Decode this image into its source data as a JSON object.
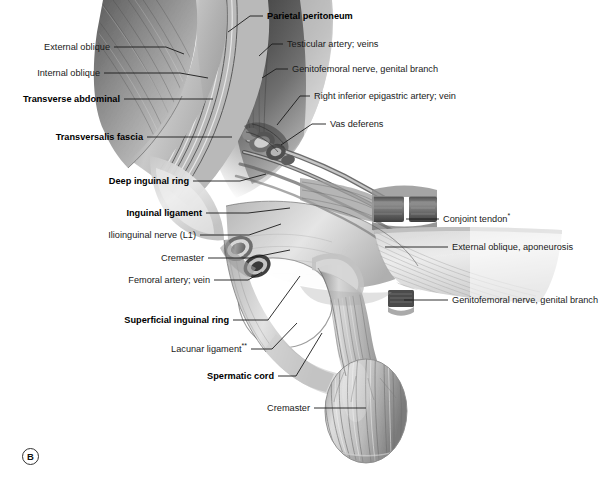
{
  "figure": {
    "panel_letter": "B",
    "background_color": "#ffffff",
    "ink_color": "#1a1a1a"
  },
  "labels_left": [
    {
      "id": "external-oblique",
      "text": "External oblique",
      "bold": false,
      "text_x": 110,
      "text_y": 50,
      "leader": [
        114,
        47,
        166,
        47,
        184,
        54
      ]
    },
    {
      "id": "internal-oblique",
      "text": "Internal oblique",
      "bold": false,
      "text_x": 100,
      "text_y": 76,
      "leader": [
        104,
        73,
        180,
        73,
        208,
        78
      ]
    },
    {
      "id": "transverse-abdominal",
      "text": "Transverse abdominal",
      "bold": true,
      "text_x": 120,
      "text_y": 102,
      "leader": [
        124,
        99,
        187,
        99,
        213,
        99
      ]
    },
    {
      "id": "transversalis-fascia",
      "text": "Transversalis fascia",
      "bold": true,
      "text_x": 143,
      "text_y": 140,
      "leader": [
        147,
        137,
        210,
        137,
        232,
        137
      ]
    },
    {
      "id": "deep-inguinal-ring",
      "text": "Deep inguinal ring",
      "bold": true,
      "text_x": 189,
      "text_y": 184,
      "leader": [
        193,
        181,
        240,
        181,
        266,
        174
      ]
    },
    {
      "id": "inguinal-ligament",
      "text": "Inguinal ligament",
      "bold": true,
      "text_x": 202,
      "text_y": 216,
      "leader": [
        206,
        213,
        248,
        213,
        290,
        208
      ]
    },
    {
      "id": "ilioinguinal-nerve",
      "text": "Ilioinguinal nerve (L1)",
      "bold": false,
      "text_x": 196,
      "text_y": 238,
      "leader": [
        200,
        235,
        249,
        235,
        281,
        224
      ]
    },
    {
      "id": "cremaster-upper",
      "text": "Cremaster",
      "bold": false,
      "text_x": 204,
      "text_y": 261,
      "leader": [
        208,
        258,
        250,
        258,
        290,
        250
      ]
    },
    {
      "id": "femoral-artery-vein",
      "text": "Femoral artery; vein",
      "bold": false,
      "text_x": 210,
      "text_y": 283,
      "leader": [
        214,
        280,
        248,
        280,
        262,
        272
      ]
    },
    {
      "id": "superficial-inguinal-ring",
      "text": "Superficial inguinal ring",
      "bold": true,
      "text_x": 229,
      "text_y": 323,
      "leader": [
        233,
        320,
        268,
        320,
        300,
        276
      ]
    },
    {
      "id": "lacunar-ligament",
      "text": "Lacunar ligament",
      "suffix": "**",
      "bold": false,
      "text_x": 247,
      "text_y": 352,
      "leader": [
        251,
        349,
        272,
        349,
        297,
        323
      ]
    },
    {
      "id": "spermatic-cord",
      "text": "Spermatic cord",
      "bold": true,
      "text_x": 274,
      "text_y": 379,
      "leader": [
        278,
        376,
        296,
        376,
        322,
        333
      ]
    },
    {
      "id": "cremaster-lower",
      "text": "Cremaster",
      "bold": false,
      "text_x": 310,
      "text_y": 411,
      "leader": [
        314,
        408,
        356,
        408,
        366,
        408
      ]
    }
  ],
  "labels_right": [
    {
      "id": "parietal-peritoneum",
      "text": "Parietal peritoneum",
      "bold": true,
      "text_x": 267,
      "text_y": 19,
      "leader": [
        263,
        16,
        250,
        16,
        228,
        32
      ]
    },
    {
      "id": "testicular-artery-veins",
      "text": "Testicular artery; veins",
      "bold": false,
      "text_x": 287,
      "text_y": 47,
      "leader": [
        283,
        44,
        272,
        44,
        259,
        56
      ]
    },
    {
      "id": "genitofemoral-nerve-genital-branch-upper",
      "text": "Genitofemoral nerve, genital branch",
      "bold": false,
      "text_x": 292,
      "text_y": 72,
      "leader": [
        288,
        69,
        276,
        69,
        262,
        78
      ]
    },
    {
      "id": "right-inferior-epigastric",
      "text": "Right inferior epigastric artery; vein",
      "bold": false,
      "text_x": 314,
      "text_y": 99,
      "leader": [
        310,
        96,
        300,
        96,
        277,
        125
      ]
    },
    {
      "id": "vas-deferens",
      "text": "Vas deferens",
      "bold": false,
      "text_x": 330,
      "text_y": 127,
      "leader": [
        326,
        124,
        312,
        124,
        281,
        145
      ]
    },
    {
      "id": "conjoint-tendon",
      "text": "Conjoint tendon",
      "suffix": "*",
      "bold": false,
      "text_x": 443,
      "text_y": 222,
      "leader": [
        439,
        219,
        420,
        219,
        406,
        219
      ]
    },
    {
      "id": "external-oblique-aponeurosis",
      "text": "External oblique, aponeurosis",
      "bold": false,
      "text_x": 452,
      "text_y": 250,
      "leader": [
        448,
        247,
        400,
        247,
        385,
        247
      ]
    },
    {
      "id": "genitofemoral-nerve-genital-branch-lower",
      "text": "Genitofemoral nerve, genital branch",
      "bold": false,
      "text_x": 452,
      "text_y": 303,
      "leader": [
        448,
        300,
        420,
        300,
        404,
        300
      ]
    }
  ]
}
